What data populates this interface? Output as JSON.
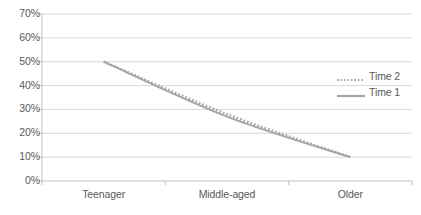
{
  "chart_data": {
    "type": "line",
    "title": "",
    "xlabel": "",
    "ylabel": "",
    "categories": [
      "Teenager",
      "Middle-aged",
      "Older"
    ],
    "ytick_labels": [
      "70%",
      "60%",
      "50%",
      "40%",
      "30%",
      "20%",
      "10%",
      "0%"
    ],
    "ytick_values": [
      70,
      60,
      50,
      40,
      30,
      20,
      10,
      0
    ],
    "ylim": [
      0,
      70
    ],
    "grid": true,
    "legend_position": "right",
    "series": [
      {
        "name": "Time 2",
        "style": "dotted",
        "color": "#a6a6a6",
        "x": [
          "Teenager",
          "Middle-aged",
          "Older"
        ],
        "values": [
          50,
          28,
          10
        ]
      },
      {
        "name": "Time 1",
        "style": "solid",
        "color": "#a6a6a6",
        "x": [
          "Teenager",
          "Middle-aged",
          "Older"
        ],
        "values": [
          50,
          27,
          10
        ]
      }
    ],
    "colors": {
      "grid": "#d9d9d9",
      "axis": "#bfbfbf",
      "text": "#5a5a5a",
      "series": "#a6a6a6",
      "background": "#ffffff"
    }
  },
  "legend": {
    "items": [
      {
        "label": "Time 2"
      },
      {
        "label": "Time 1"
      }
    ]
  },
  "axes": {
    "y": {
      "ticks": [
        {
          "label": "70%"
        },
        {
          "label": "60%"
        },
        {
          "label": "50%"
        },
        {
          "label": "40%"
        },
        {
          "label": "30%"
        },
        {
          "label": "20%"
        },
        {
          "label": "10%"
        },
        {
          "label": "0%"
        }
      ]
    },
    "x": {
      "ticks": [
        {
          "label": "Teenager"
        },
        {
          "label": "Middle-aged"
        },
        {
          "label": "Older"
        }
      ]
    }
  }
}
